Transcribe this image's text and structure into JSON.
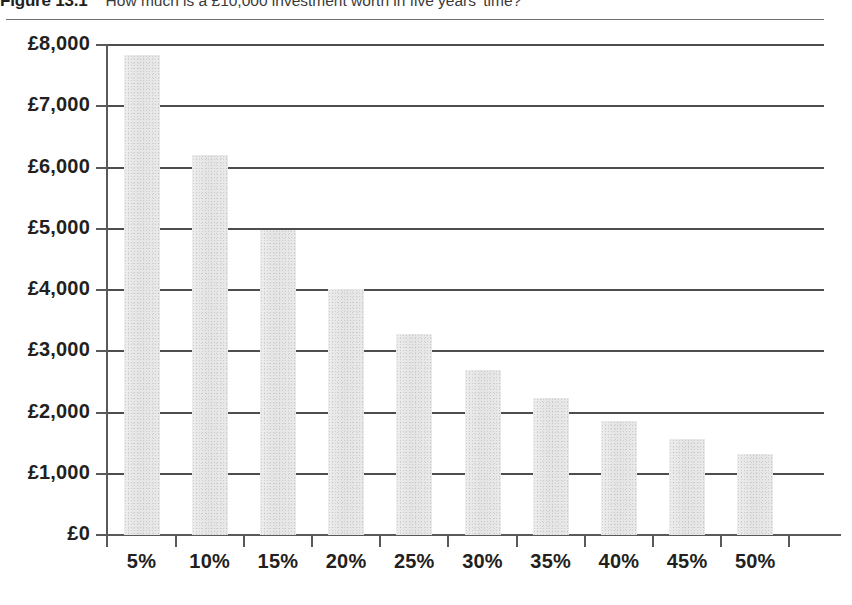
{
  "figure": {
    "label": "Figure 13.1",
    "caption": "How much is a £10,000 investment worth in five years' time?"
  },
  "chart_data": {
    "type": "bar",
    "title": "How much is a £10,000 investment worth in five years' time?",
    "xlabel": "",
    "ylabel": "",
    "categories": [
      "5%",
      "10%",
      "15%",
      "20%",
      "25%",
      "30%",
      "35%",
      "40%",
      "45%",
      "50%"
    ],
    "values": [
      7835,
      6209,
      4972,
      4019,
      3277,
      2693,
      2230,
      1859,
      1561,
      1317
    ],
    "ylim": [
      0,
      8000
    ],
    "ytick_values": [
      0,
      1000,
      2000,
      3000,
      4000,
      5000,
      6000,
      7000,
      8000
    ],
    "ytick_labels": [
      "£0",
      "£1,000",
      "£2,000",
      "£3,000",
      "£4,000",
      "£5,000",
      "£6,000",
      "£7,000",
      "£8,000"
    ],
    "grid": true,
    "legend": "none",
    "bar_color": "#e8e8e8",
    "axis_color": "#58595b",
    "gridline_color": "#4d4d4f"
  }
}
